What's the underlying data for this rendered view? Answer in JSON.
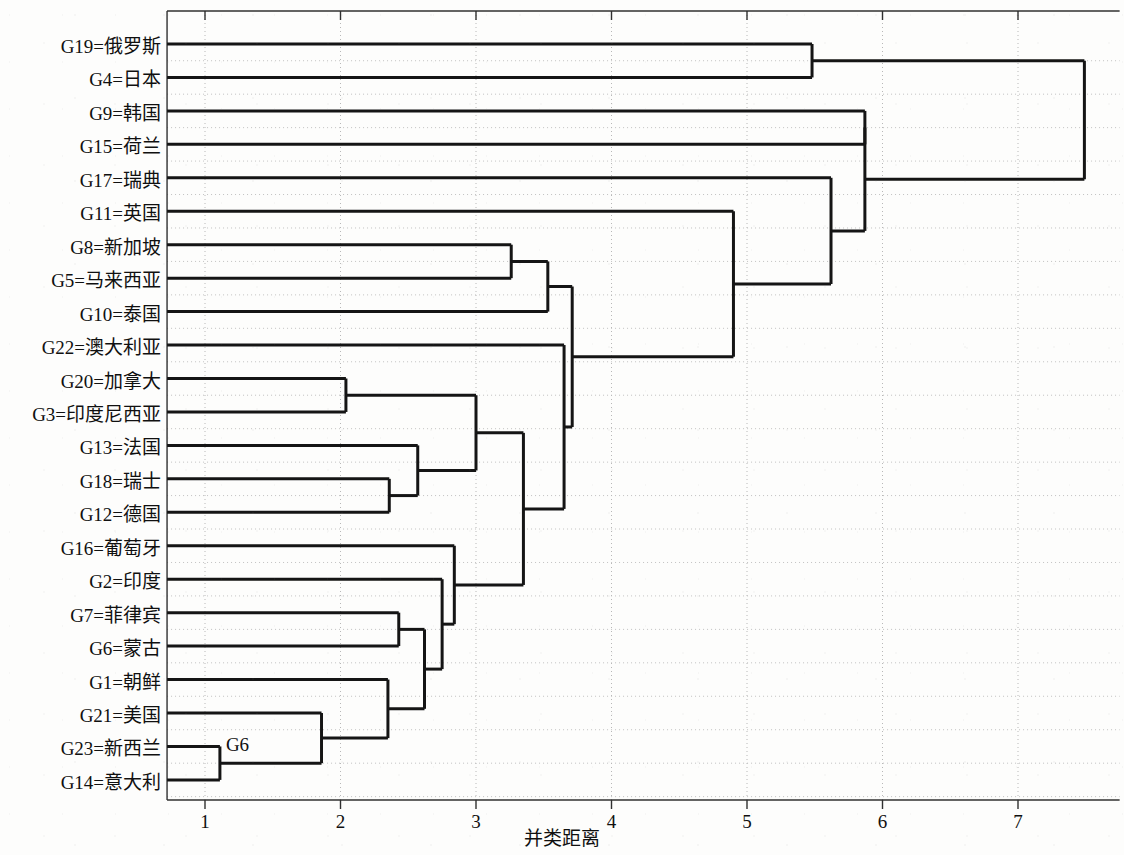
{
  "figure": {
    "type": "dendrogram",
    "x_axis_title": "并类距离",
    "annotation": "G6"
  },
  "axis": {
    "ticks": [
      "1",
      "2",
      "3",
      "4",
      "5",
      "6",
      "7"
    ],
    "tick_values": [
      1,
      2,
      3,
      4,
      5,
      6,
      7
    ],
    "xlim": [
      0.72,
      7.75
    ],
    "grid": true
  },
  "leaves": [
    {
      "label": "G19=俄罗斯",
      "id": "G19",
      "name": "俄罗斯"
    },
    {
      "label": "G4=日本",
      "id": "G4",
      "name": "日本"
    },
    {
      "label": "G9=韩国",
      "id": "G9",
      "name": "韩国"
    },
    {
      "label": "G15=荷兰",
      "id": "G15",
      "name": "荷兰"
    },
    {
      "label": "G17=瑞典",
      "id": "G17",
      "name": "瑞典"
    },
    {
      "label": "G11=英国",
      "id": "G11",
      "name": "英国"
    },
    {
      "label": "G8=新加坡",
      "id": "G8",
      "name": "新加坡"
    },
    {
      "label": "G5=马来西亚",
      "id": "G5",
      "name": "马来西亚"
    },
    {
      "label": "G10=泰国",
      "id": "G10",
      "name": "泰国"
    },
    {
      "label": "G22=澳大利亚",
      "id": "G22",
      "name": "澳大利亚"
    },
    {
      "label": "G20=加拿大",
      "id": "G20",
      "name": "加拿大"
    },
    {
      "label": "G3=印度尼西亚",
      "id": "G3",
      "name": "印度尼西亚"
    },
    {
      "label": "G13=法国",
      "id": "G13",
      "name": "法国"
    },
    {
      "label": "G18=瑞士",
      "id": "G18",
      "name": "瑞士"
    },
    {
      "label": "G12=德国",
      "id": "G12",
      "name": "德国"
    },
    {
      "label": "G16=葡萄牙",
      "id": "G16",
      "name": "葡萄牙"
    },
    {
      "label": "G2=印度",
      "id": "G2",
      "name": "印度"
    },
    {
      "label": "G7=菲律宾",
      "id": "G7",
      "name": "菲律宾"
    },
    {
      "label": "G6=蒙古",
      "id": "G6",
      "name": "蒙古"
    },
    {
      "label": "G1=朝鲜",
      "id": "G1",
      "name": "朝鲜"
    },
    {
      "label": "G21=美国",
      "id": "G21",
      "name": "美国"
    },
    {
      "label": "G23=新西兰",
      "id": "G23",
      "name": "新西兰"
    },
    {
      "label": "G14=意大利",
      "id": "G14",
      "name": "意大利"
    }
  ],
  "chart_data": {
    "type": "dendrogram",
    "title": "",
    "xlabel": "并类距离",
    "ylabel": "",
    "xlim": [
      0.72,
      7.75
    ],
    "xticks": [
      1,
      2,
      3,
      4,
      5,
      6,
      7
    ],
    "orientation": "horizontal-left-to-right",
    "leaf_order": [
      "G19",
      "G4",
      "G9",
      "G15",
      "G17",
      "G11",
      "G8",
      "G5",
      "G10",
      "G22",
      "G20",
      "G3",
      "G13",
      "G18",
      "G12",
      "G16",
      "G2",
      "G7",
      "G6",
      "G1",
      "G21",
      "G23",
      "G14"
    ],
    "leaf_labels": [
      "G19=俄罗斯",
      "G4=日本",
      "G9=韩国",
      "G15=荷兰",
      "G17=瑞典",
      "G11=英国",
      "G8=新加坡",
      "G5=马来西亚",
      "G10=泰国",
      "G22=澳大利亚",
      "G20=加拿大",
      "G3=印度尼西亚",
      "G13=法国",
      "G18=瑞士",
      "G12=德国",
      "G16=葡萄牙",
      "G2=印度",
      "G7=菲律宾",
      "G6=蒙古",
      "G1=朝鲜",
      "G21=美国",
      "G23=新西兰",
      "G14=意大利"
    ],
    "merges": [
      {
        "id": "m1",
        "left": "G23",
        "right": "G14",
        "distance": 1.11
      },
      {
        "id": "m2",
        "left": "m1",
        "right": "G21",
        "distance": 1.86
      },
      {
        "id": "m3",
        "left": "G20",
        "right": "G3",
        "distance": 2.04
      },
      {
        "id": "m4",
        "left": "m2",
        "right": "G1",
        "distance": 2.35
      },
      {
        "id": "m5",
        "left": "G18",
        "right": "G12",
        "distance": 2.36
      },
      {
        "id": "m6",
        "left": "G7",
        "right": "G6",
        "distance": 2.43
      },
      {
        "id": "m7",
        "left": "G13",
        "right": "m5",
        "distance": 2.57
      },
      {
        "id": "m8",
        "left": "m6",
        "right": "m4",
        "distance": 2.62
      },
      {
        "id": "m9",
        "left": "G2",
        "right": "m8",
        "distance": 2.75
      },
      {
        "id": "m10",
        "left": "G16",
        "right": "m9",
        "distance": 2.84
      },
      {
        "id": "m11",
        "left": "m3",
        "right": "m7",
        "distance": 3.0
      },
      {
        "id": "m12",
        "left": "G8",
        "right": "G5",
        "distance": 3.26
      },
      {
        "id": "m13",
        "left": "m11",
        "right": "m10",
        "distance": 3.35
      },
      {
        "id": "m14",
        "left": "m12",
        "right": "G10",
        "distance": 3.53
      },
      {
        "id": "m15",
        "left": "G22",
        "right": "m13",
        "distance": 3.65
      },
      {
        "id": "m16",
        "left": "m14",
        "right": "m15",
        "distance": 3.71
      },
      {
        "id": "m17",
        "left": "G11",
        "right": "m16",
        "distance": 4.9
      },
      {
        "id": "m18",
        "left": "G19",
        "right": "G4",
        "distance": 5.48
      },
      {
        "id": "m19",
        "left": "G17",
        "right": "m17",
        "distance": 5.62
      },
      {
        "id": "m20",
        "left": "G9",
        "right": "G15",
        "distance": 5.87
      },
      {
        "id": "m21",
        "left": "m20",
        "right": "m19",
        "distance": 5.87
      },
      {
        "id": "m22",
        "left": "m18",
        "right": "m21",
        "distance": 7.49
      }
    ]
  },
  "colors": {
    "line": "#151515",
    "grid": "#b8b8b8",
    "axis": "#303030",
    "background": "#fdfdfc",
    "text": "#101010"
  }
}
